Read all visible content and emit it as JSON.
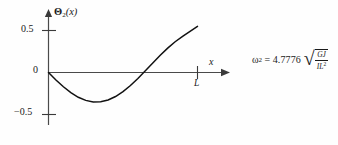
{
  "figure": {
    "background_color": "#fefefe",
    "ink_color": "#111111",
    "axis_color": "#4a4a4a"
  },
  "axes": {
    "y_axis_title": "Θ",
    "y_axis_title_subscript": "2",
    "y_axis_title_argument": "(x)",
    "x_axis_label": "x",
    "x_tick_label": "L",
    "y_ticks": [
      "0.5",
      "0",
      "−0.5"
    ]
  },
  "equation": {
    "symbol": "ω",
    "subscript": "2",
    "equals": "=",
    "coefficient": "4.7776",
    "radical_sign": "√",
    "numerator": "GJ",
    "denominator": "IL",
    "denominator_exponent": "2",
    "plain_text": "ω₂ = 4.7776 √(GJ / IL²)"
  },
  "chart_data": {
    "type": "line",
    "title": "",
    "xlabel": "x",
    "ylabel": "Θ2(x)",
    "xlim": [
      0,
      1
    ],
    "ylim": [
      -0.6,
      0.65
    ],
    "grid": false,
    "legend": null,
    "xtick_values": [
      0,
      1
    ],
    "xtick_labels": [
      "0",
      "L"
    ],
    "ytick_values": [
      0.5,
      0,
      -0.5
    ],
    "ytick_labels": [
      "0.5",
      "0",
      "-0.5"
    ],
    "series": [
      {
        "name": "Θ2(x) mode shape",
        "x": [
          0.0,
          0.05,
          0.1,
          0.15,
          0.2,
          0.25,
          0.3,
          0.35,
          0.4,
          0.45,
          0.5,
          0.55,
          0.6,
          0.65,
          0.7,
          0.75,
          0.8,
          0.85,
          0.9,
          0.95,
          1.0
        ],
        "y": [
          0.0,
          -0.09,
          -0.17,
          -0.24,
          -0.295,
          -0.332,
          -0.35,
          -0.348,
          -0.327,
          -0.286,
          -0.228,
          -0.155,
          -0.071,
          0.02,
          0.113,
          0.205,
          0.29,
          0.366,
          0.43,
          0.49,
          0.55
        ]
      }
    ],
    "annotations": [
      {
        "text": "ω₂ = 4.7776 √(GJ/IL²)",
        "x": 1.45,
        "y": 0.05
      }
    ]
  }
}
